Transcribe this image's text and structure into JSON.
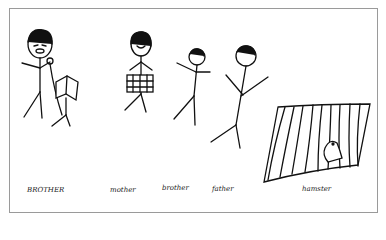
{
  "drawing": {
    "description": "Child's stick-figure family drawing",
    "labels": [
      {
        "text": "BROTHER",
        "x": 27,
        "y": 190
      },
      {
        "text": "mother",
        "x": 110,
        "y": 190
      },
      {
        "text": "brother",
        "x": 162,
        "y": 188
      },
      {
        "text": "father",
        "x": 212,
        "y": 189
      },
      {
        "text": "hamster",
        "x": 302,
        "y": 189
      }
    ]
  }
}
